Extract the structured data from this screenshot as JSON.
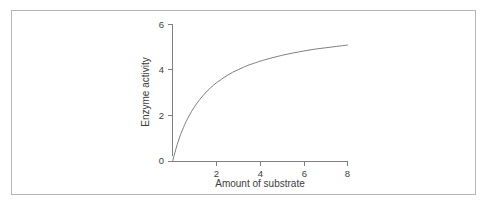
{
  "figure": {
    "background_color": "#ffffff",
    "border_color": "#b5b5b5",
    "line_color": "#808080",
    "text_color": "#3c3c3c"
  },
  "chart_data": {
    "type": "line",
    "title": "",
    "subtitle": "",
    "xlabel": "Amount of substrate",
    "ylabel": "Enzyme activity",
    "xlim": [
      0,
      8.1
    ],
    "ylim": [
      0,
      6
    ],
    "xticks": [
      2,
      4,
      6,
      8
    ],
    "xtick_labels": [
      "2",
      "4",
      "6",
      "8"
    ],
    "yticks": [
      0,
      2,
      4,
      6
    ],
    "ytick_labels": [
      "0",
      "2",
      "4",
      "6"
    ],
    "grid": false,
    "legend": null,
    "legend_position": "none",
    "annotations": [],
    "series": [
      {
        "name": "Enzyme activity vs substrate",
        "model": "saturation (Michaelis-Menten): v = 6.1 * x / (x + 1.55)",
        "color": "#808080",
        "line_width": 1,
        "x": [
          0,
          0.25,
          0.5,
          0.75,
          1,
          1.25,
          1.5,
          1.75,
          2,
          2.25,
          2.5,
          2.75,
          3,
          3.25,
          3.5,
          3.75,
          4,
          4.5,
          5,
          5.5,
          6,
          6.5,
          7,
          7.5,
          8
        ],
        "values": [
          0,
          0.85,
          1.49,
          1.99,
          2.39,
          2.72,
          3.0,
          3.24,
          3.44,
          3.61,
          3.77,
          3.91,
          4.02,
          4.13,
          4.23,
          4.31,
          4.39,
          4.53,
          4.65,
          4.75,
          4.84,
          4.92,
          4.98,
          5.04,
          5.1
        ],
        "endpoint_value": 5.1,
        "plateau_value": 5.1
      }
    ]
  }
}
